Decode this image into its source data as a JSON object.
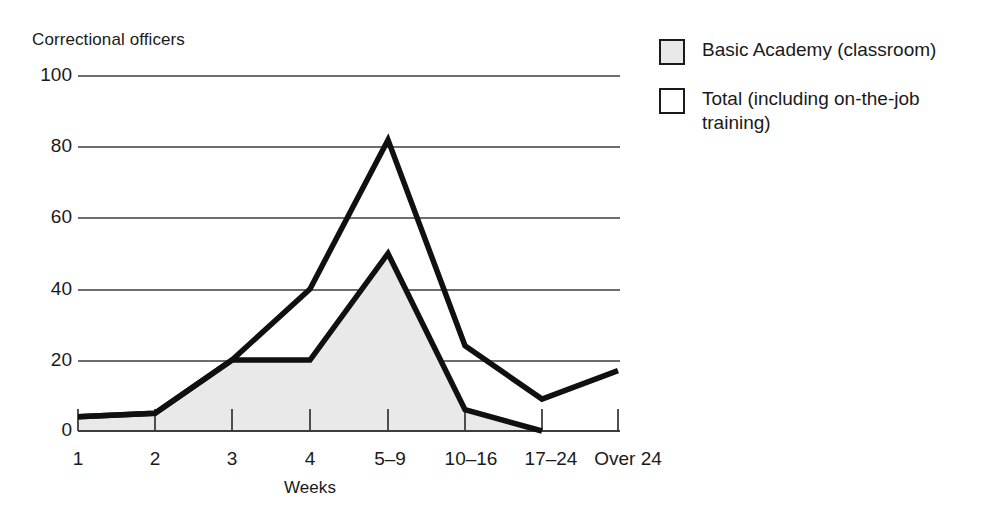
{
  "chart_data": {
    "type": "area",
    "title": "",
    "ylabel": "Correctional officers",
    "xlabel": "Weeks",
    "categories": [
      "1",
      "2",
      "3",
      "4",
      "5–9",
      "10–16",
      "17–24",
      "Over 24"
    ],
    "series": [
      {
        "name": "Basic Academy (classroom)",
        "style": "filled-area",
        "fill": "#e9e9e9",
        "values": [
          4,
          5,
          20,
          20,
          50,
          6,
          0,
          0
        ]
      },
      {
        "name": "Total (including on-the-job training)",
        "style": "line",
        "fill": "#ffffff",
        "values": [
          4,
          5,
          20,
          40,
          82,
          24,
          9,
          17
        ]
      }
    ],
    "ylim": [
      0,
      100
    ],
    "yticks": [
      0,
      20,
      40,
      60,
      80,
      100
    ],
    "ytick_labels": [
      "0",
      "20",
      "40",
      "60",
      "80",
      "100"
    ],
    "grid": true,
    "legend_position": "right"
  },
  "legend": {
    "items": [
      {
        "label": "Basic Academy (classroom)",
        "swatch": "filled"
      },
      {
        "label": "Total (including on-the-job training)",
        "swatch": "hollow"
      }
    ]
  },
  "colors": {
    "line": "#1a1a1a",
    "grid": "#4d4d4d",
    "area_fill": "#e9e9e9",
    "background": "#ffffff"
  }
}
